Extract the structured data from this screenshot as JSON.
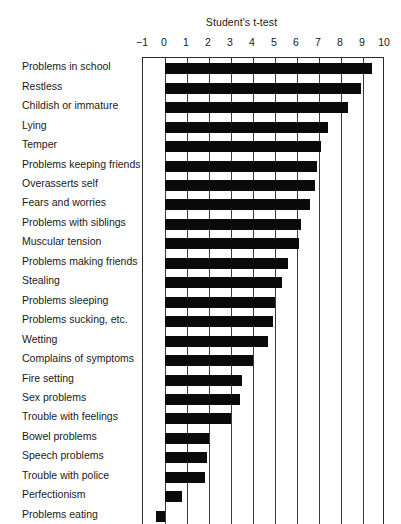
{
  "chart_data": {
    "type": "bar",
    "orientation": "horizontal",
    "title": "Student's t-test",
    "xlabel": "",
    "ylabel": "",
    "xlim": [
      -1,
      10
    ],
    "xticks": [
      -1,
      0,
      1,
      2,
      3,
      4,
      5,
      6,
      7,
      8,
      9,
      10
    ],
    "xtick_labels": [
      "−1",
      "0",
      "1",
      "2",
      "3",
      "4",
      "5",
      "6",
      "7",
      "8",
      "9",
      "10"
    ],
    "grid": true,
    "grid_axis": "x",
    "legend": false,
    "bar_color": "#0a0a0a",
    "categories": [
      "Problems in school",
      "Restless",
      "Childish or immature",
      "Lying",
      "Temper",
      "Problems keeping friends",
      "Overasserts self",
      "Fears and worries",
      "Problems with siblings",
      "Muscular tension",
      "Problems making friends",
      "Stealing",
      "Problems sleeping",
      "Problems sucking, etc.",
      "Wetting",
      "Complains of symptoms",
      "Fire setting",
      "Sex problems",
      "Trouble with feelings",
      "Bowel problems",
      "Speech problems",
      "Trouble with police",
      "Perfectionism",
      "Problems eating"
    ],
    "values": [
      9.4,
      8.9,
      8.3,
      7.4,
      7.1,
      6.9,
      6.8,
      6.6,
      6.2,
      6.1,
      5.6,
      5.3,
      5.0,
      4.9,
      4.7,
      4.0,
      3.5,
      3.4,
      3.0,
      2.0,
      1.9,
      1.8,
      0.75,
      -0.4
    ]
  }
}
